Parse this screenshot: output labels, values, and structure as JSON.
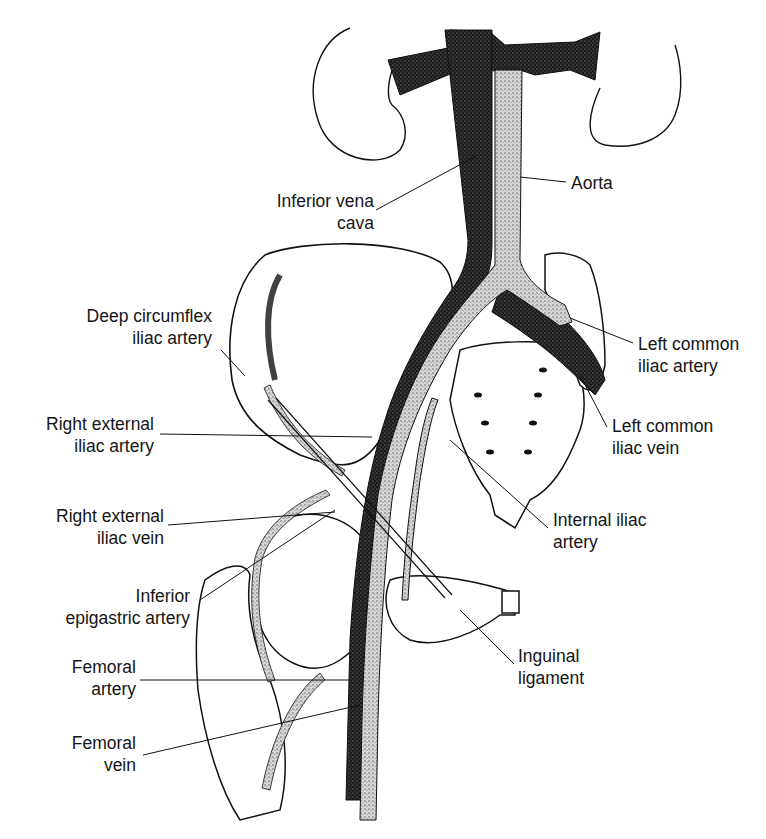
{
  "figure": {
    "colors": {
      "background": "#ffffff",
      "ink": "#111111",
      "vein_fill": "#2a2a2a",
      "artery_fill": "#bdbdbd"
    }
  },
  "labels": {
    "inferior_vena_cava": {
      "line1": "Inferior vena",
      "line2": "cava"
    },
    "aorta": {
      "line1": "Aorta"
    },
    "deep_circumflex_iliac_artery": {
      "line1": "Deep circumflex",
      "line2": "iliac artery"
    },
    "left_common_iliac_artery": {
      "line1": "Left common",
      "line2": "iliac artery"
    },
    "right_external_iliac_artery": {
      "line1": "Right external",
      "line2": "iliac artery"
    },
    "left_common_iliac_vein": {
      "line1": "Left common",
      "line2": "iliac vein"
    },
    "right_external_iliac_vein": {
      "line1": "Right external",
      "line2": "iliac vein"
    },
    "internal_iliac_artery": {
      "line1": "Internal iliac",
      "line2": "artery"
    },
    "inferior_epigastric_artery": {
      "line1": "Inferior",
      "line2": "epigastric artery"
    },
    "inguinal_ligament": {
      "line1": "Inguinal",
      "line2": "ligament"
    },
    "femoral_artery": {
      "line1": "Femoral",
      "line2": "artery"
    },
    "femoral_vein": {
      "line1": "Femoral",
      "line2": "vein"
    }
  }
}
